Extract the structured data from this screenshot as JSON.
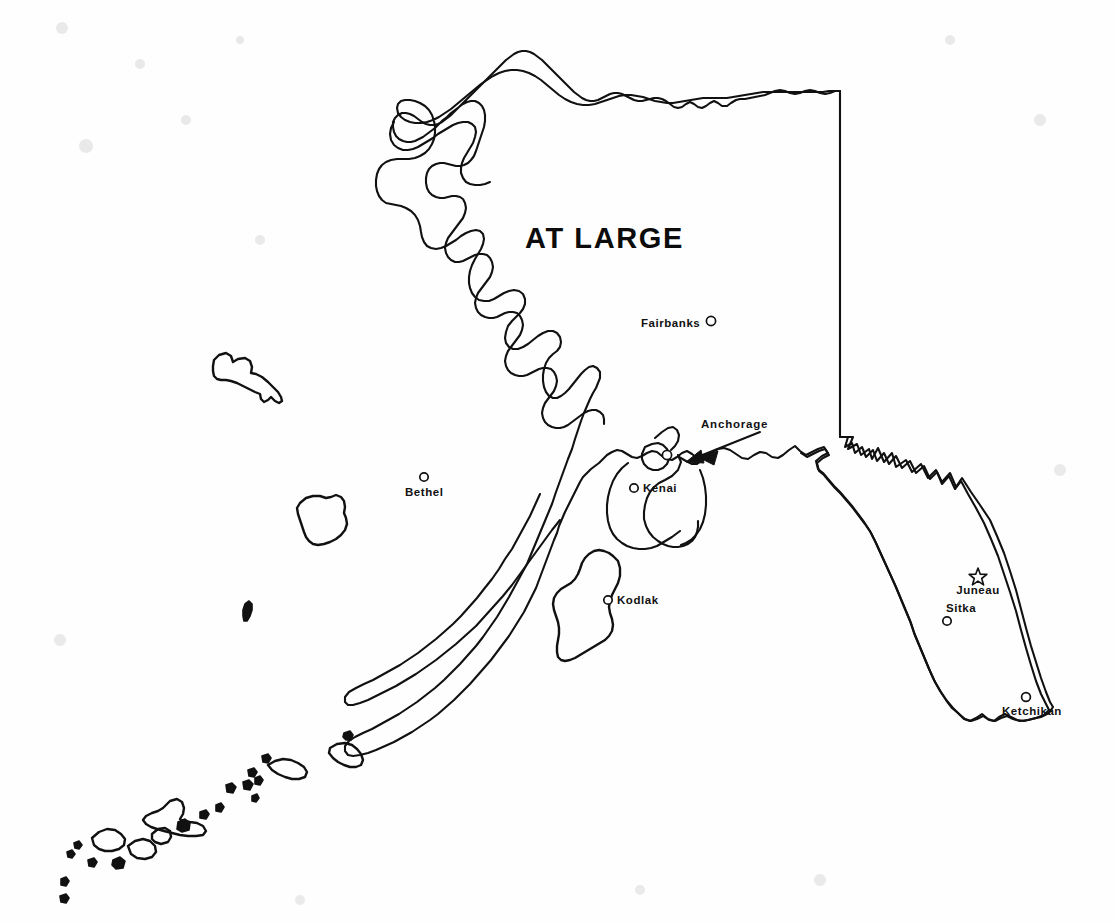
{
  "map": {
    "title": "AT LARGE",
    "title_position": {
      "x": 525,
      "y": 248
    },
    "region": "Alaska",
    "background_color": "#fefefe",
    "line_color": "#111111",
    "width": 1116,
    "height": 923
  },
  "cities": [
    {
      "name": "Fairbanks",
      "label": "Fairbanks",
      "marker": "circle",
      "label_x": 641,
      "label_y": 327,
      "label_anchor": "start",
      "dot_x": 711,
      "dot_y": 321,
      "dot_r": 4.6
    },
    {
      "name": "Bethel",
      "label": "Bethel",
      "marker": "circle",
      "label_x": 405,
      "label_y": 496,
      "label_anchor": "start",
      "dot_x": 424,
      "dot_y": 477,
      "dot_r": 4.2
    },
    {
      "name": "Anchorage",
      "label": "Anchorage",
      "marker": "circle",
      "label_x": 701,
      "label_y": 428,
      "label_anchor": "start",
      "dot_x": 667,
      "dot_y": 455,
      "dot_r": 4.6
    },
    {
      "name": "Kenai",
      "label": "Kenai",
      "marker": "circle",
      "label_x": 643,
      "label_y": 492,
      "label_anchor": "start",
      "dot_x": 634,
      "dot_y": 488,
      "dot_r": 4.2
    },
    {
      "name": "Kodiak",
      "label": "Kodlak",
      "marker": "circle",
      "label_x": 617,
      "label_y": 604,
      "label_anchor": "start",
      "dot_x": 608,
      "dot_y": 600,
      "dot_r": 4.2
    },
    {
      "name": "Juneau",
      "label": "Juneau",
      "marker": "star",
      "label_x": 978,
      "label_y": 594,
      "label_anchor": "middle",
      "dot_x": 978,
      "dot_y": 575,
      "dot_r": 7
    },
    {
      "name": "Sitka",
      "label": "Sitka",
      "marker": "circle",
      "label_x": 946,
      "label_y": 612,
      "label_anchor": "start",
      "dot_x": 947,
      "dot_y": 621,
      "dot_r": 4.2
    },
    {
      "name": "Ketchikan",
      "label": "Ketchikan",
      "marker": "circle",
      "label_x": 1002,
      "label_y": 715,
      "label_anchor": "start",
      "dot_x": 1026,
      "dot_y": 697,
      "dot_r": 4.4
    }
  ],
  "annotations": [
    {
      "name": "anchorage-pointer",
      "type": "arrow",
      "from_x": 760,
      "from_y": 432,
      "to_x": 686,
      "to_y": 462,
      "target_city": "Anchorage"
    }
  ],
  "legend": {
    "capital_marker": "star",
    "city_marker": "circle"
  }
}
